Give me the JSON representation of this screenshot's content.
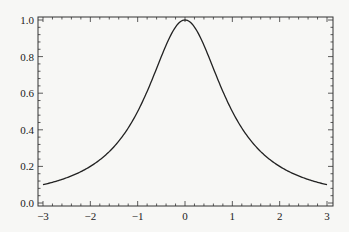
{
  "chart_data": {
    "type": "line",
    "title": "",
    "xlabel": "",
    "ylabel": "",
    "xlim": [
      -3,
      3
    ],
    "ylim": [
      0,
      1
    ],
    "grid": false,
    "legend": null,
    "x_ticks": [
      "-3",
      "-2",
      "-1",
      "0",
      "1",
      "2",
      "3"
    ],
    "y_ticks": [
      "0.0",
      "0.2",
      "0.4",
      "0.6",
      "0.8",
      "1.0"
    ],
    "series": [
      {
        "name": "f(x) = 1/(1+x^2)",
        "color": "#222222",
        "x": [
          -3,
          -2.5,
          -2,
          -1.5,
          -1,
          -0.5,
          0,
          0.5,
          1,
          1.5,
          2,
          2.5,
          3
        ],
        "y": [
          0.1,
          0.138,
          0.2,
          0.308,
          0.5,
          0.8,
          1.0,
          0.8,
          0.5,
          0.308,
          0.2,
          0.138,
          0.1
        ]
      }
    ]
  }
}
